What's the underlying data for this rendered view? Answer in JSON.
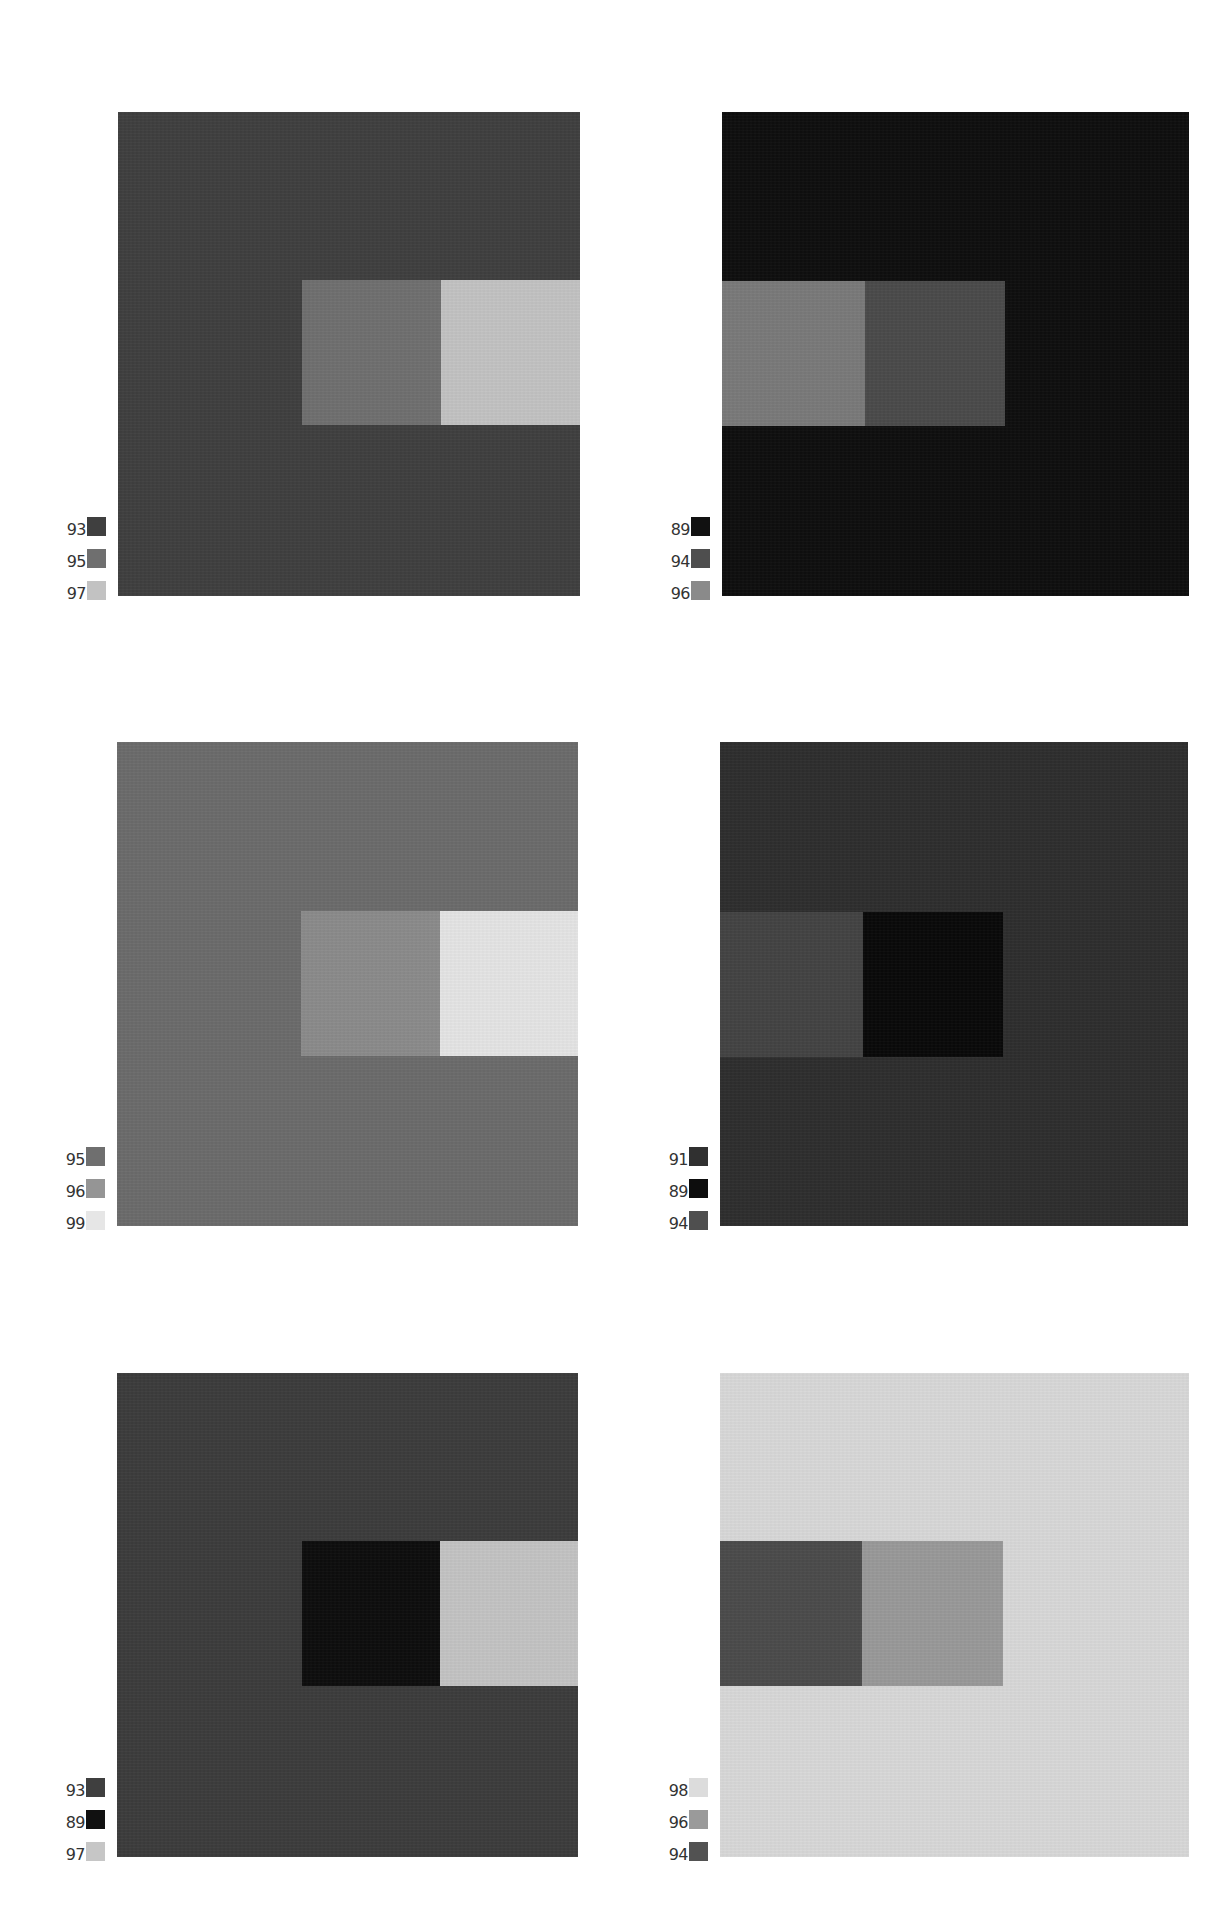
{
  "plate": {
    "background": "#ffffff",
    "panels": [
      {
        "id": "row1-left",
        "box": {
          "x": 118,
          "y": 112,
          "w": 462,
          "h": 484
        },
        "ground": "#3f3f3f",
        "left_rect": {
          "x": 302,
          "y": 280,
          "w": 139,
          "h": 145,
          "color": "#6f6f6f"
        },
        "right_rect": {
          "x": 441,
          "y": 280,
          "w": 139,
          "h": 145,
          "color": "#c2c2c2"
        },
        "key": [
          {
            "label": "93",
            "color": "#3f3f3f"
          },
          {
            "label": "95",
            "color": "#6f6f6f"
          },
          {
            "label": "97",
            "color": "#c2c2c2"
          }
        ]
      },
      {
        "id": "row1-right",
        "box": {
          "x": 722,
          "y": 112,
          "w": 467,
          "h": 484
        },
        "ground": "#0e0e0e",
        "left_rect": {
          "x": 722,
          "y": 281,
          "w": 143,
          "h": 145,
          "color": "#797979"
        },
        "right_rect": {
          "x": 865,
          "y": 281,
          "w": 140,
          "h": 145,
          "color": "#4a4a4a"
        },
        "key": [
          {
            "label": "89",
            "color": "#111111"
          },
          {
            "label": "94",
            "color": "#4e4e4e"
          },
          {
            "label": "96",
            "color": "#8a8a8a"
          }
        ]
      },
      {
        "id": "row2-left",
        "box": {
          "x": 117,
          "y": 742,
          "w": 461,
          "h": 484
        },
        "ground": "#6b6b6b",
        "left_rect": {
          "x": 301,
          "y": 911,
          "w": 139,
          "h": 145,
          "color": "#8b8b8b"
        },
        "right_rect": {
          "x": 440,
          "y": 911,
          "w": 138,
          "h": 145,
          "color": "#e4e4e4"
        },
        "key": [
          {
            "label": "95",
            "color": "#6f6f6f"
          },
          {
            "label": "96",
            "color": "#959595"
          },
          {
            "label": "99",
            "color": "#e6e6e6"
          }
        ]
      },
      {
        "id": "row2-right",
        "box": {
          "x": 720,
          "y": 742,
          "w": 468,
          "h": 484
        },
        "ground": "#2e2e2e",
        "left_rect": {
          "x": 720,
          "y": 912,
          "w": 143,
          "h": 145,
          "color": "#434343"
        },
        "right_rect": {
          "x": 863,
          "y": 912,
          "w": 140,
          "h": 145,
          "color": "#090909"
        },
        "key": [
          {
            "label": "91",
            "color": "#303030"
          },
          {
            "label": "89",
            "color": "#0d0d0d"
          },
          {
            "label": "94",
            "color": "#4f4f4f"
          }
        ]
      },
      {
        "id": "row3-left",
        "box": {
          "x": 117,
          "y": 1373,
          "w": 461,
          "h": 484
        },
        "ground": "#3c3c3c",
        "left_rect": {
          "x": 302,
          "y": 1541,
          "w": 138,
          "h": 145,
          "color": "#0d0d0d"
        },
        "right_rect": {
          "x": 440,
          "y": 1541,
          "w": 138,
          "h": 145,
          "color": "#c3c3c3"
        },
        "key": [
          {
            "label": "93",
            "color": "#3f3f3f"
          },
          {
            "label": "89",
            "color": "#111111"
          },
          {
            "label": "97",
            "color": "#c6c6c6"
          }
        ]
      },
      {
        "id": "row3-right",
        "box": {
          "x": 720,
          "y": 1373,
          "w": 469,
          "h": 484
        },
        "ground": "#d8d8d8",
        "left_rect": {
          "x": 720,
          "y": 1541,
          "w": 142,
          "h": 145,
          "color": "#4b4b4b"
        },
        "right_rect": {
          "x": 862,
          "y": 1541,
          "w": 141,
          "h": 145,
          "color": "#999999"
        },
        "key": [
          {
            "label": "98",
            "color": "#dcdcdc"
          },
          {
            "label": "96",
            "color": "#9a9a9a"
          },
          {
            "label": "94",
            "color": "#525252"
          }
        ]
      }
    ]
  }
}
